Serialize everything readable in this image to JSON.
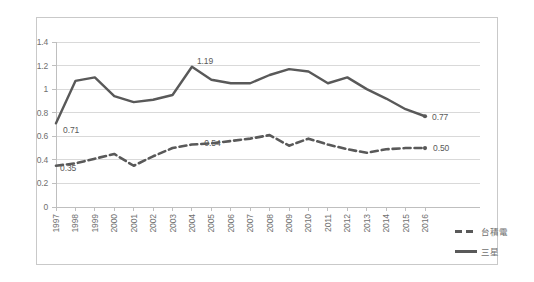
{
  "chart_data": {
    "type": "line",
    "title": "",
    "xlabel": "",
    "ylabel": "",
    "ylim": [
      0,
      1.4
    ],
    "grid": true,
    "legend_position": "right",
    "categories": [
      "1997",
      "1998",
      "1999",
      "2000",
      "2001",
      "2002",
      "2003",
      "2004",
      "2005",
      "2006",
      "2007",
      "2008",
      "2009",
      "2010",
      "2011",
      "2012",
      "2013",
      "2014",
      "2015",
      "2016"
    ],
    "yticks": [
      "0",
      "0.2",
      "0.4",
      "0.6",
      "0.8",
      "1",
      "1.2",
      "1.4"
    ],
    "ytick_values": [
      0,
      0.2,
      0.4,
      0.6,
      0.8,
      1,
      1.2,
      1.4
    ],
    "series": [
      {
        "name": "台積電",
        "style": "dashed",
        "color": "#595959",
        "values": [
          0.35,
          0.37,
          0.41,
          0.45,
          0.35,
          0.43,
          0.5,
          0.53,
          0.54,
          0.56,
          0.58,
          0.61,
          0.52,
          0.58,
          0.53,
          0.49,
          0.46,
          0.49,
          0.5,
          0.5
        ]
      },
      {
        "name": "三星",
        "style": "solid",
        "color": "#595959",
        "values": [
          0.71,
          1.07,
          1.1,
          0.94,
          0.89,
          0.91,
          0.95,
          1.19,
          1.08,
          1.05,
          1.05,
          1.12,
          1.17,
          1.15,
          1.05,
          1.1,
          1.0,
          0.92,
          0.83,
          0.77
        ]
      }
    ],
    "annotations": [
      {
        "series": "三星",
        "category": "1997",
        "text": "0.71"
      },
      {
        "series": "三星",
        "category": "2004",
        "text": "1.19"
      },
      {
        "series": "三星",
        "category": "2016",
        "text": "0.77"
      },
      {
        "series": "台積電",
        "category": "1997",
        "text": "0.35"
      },
      {
        "series": "台積電",
        "category": "2005",
        "text": "0.54"
      },
      {
        "series": "台積電",
        "category": "2016",
        "text": "0.50"
      }
    ]
  },
  "axis": {
    "y_tick_labels": [
      "1.4",
      "1.2",
      "1",
      "0.8",
      "0.6",
      "0.4",
      "0.2",
      "0"
    ],
    "x_tick_labels": [
      "1997",
      "1998",
      "1999",
      "2000",
      "2001",
      "2002",
      "2003",
      "2004",
      "2005",
      "2006",
      "2007",
      "2008",
      "2009",
      "2010",
      "2011",
      "2012",
      "2013",
      "2014",
      "2015",
      "2016"
    ]
  },
  "legend": {
    "items": [
      {
        "label": "台積電",
        "style": "dashed"
      },
      {
        "label": "三星",
        "style": "solid"
      }
    ]
  },
  "labels": {
    "samsung_start": "0.71",
    "samsung_peak": "1.19",
    "samsung_end": "0.77",
    "tsmc_start": "0.35",
    "tsmc_mid": "0.54",
    "tsmc_end": "0.50"
  },
  "colors": {
    "line": "#595959",
    "grid": "#d9d9d9",
    "axis": "#bfbfbf",
    "text": "#6f6f6f",
    "frame": "#c9c9c9",
    "background": "#ffffff"
  }
}
